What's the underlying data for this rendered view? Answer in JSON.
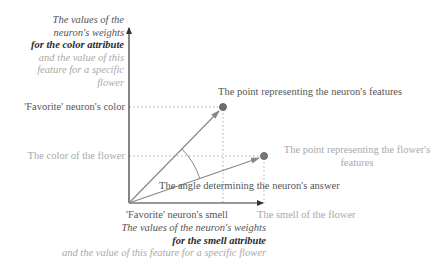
{
  "y_axis": {
    "title_lines": [
      {
        "text": "The values of the",
        "style": "dark-italic"
      },
      {
        "text": "neuron's weights",
        "style": "dark-italic"
      },
      {
        "text": "for the color attribute",
        "style": "bold-italic"
      },
      {
        "text": "and the value of this",
        "style": "light-italic"
      },
      {
        "text": "feature for a specific",
        "style": "light-italic"
      },
      {
        "text": "flower",
        "style": "light-italic"
      }
    ],
    "tick_neuron": "'Favorite' neuron's color",
    "tick_flower": "The color of the flower"
  },
  "x_axis": {
    "title_lines": [
      {
        "text": "The values of the neuron's weights",
        "style": "dark-italic"
      },
      {
        "text": "for the smell attribute",
        "style": "bold-italic"
      },
      {
        "text": "and the value of this feature for a specific flower",
        "style": "light-italic"
      }
    ],
    "tick_neuron": "'Favorite' neuron's smell",
    "tick_flower": "The smell of the flower"
  },
  "annotations": {
    "neuron_point": "The point representing the neuron's features",
    "flower_point_line1": "The point representing the flower's",
    "flower_point_line2": "features",
    "angle": "The angle determining the neuron's answer"
  },
  "colors": {
    "axis": "#333333",
    "vector": "#888888",
    "point_fill": "#6e6e6e",
    "dotted": "#aaaaaa",
    "text_dark": "#555555",
    "text_light": "#a9a9a9"
  }
}
